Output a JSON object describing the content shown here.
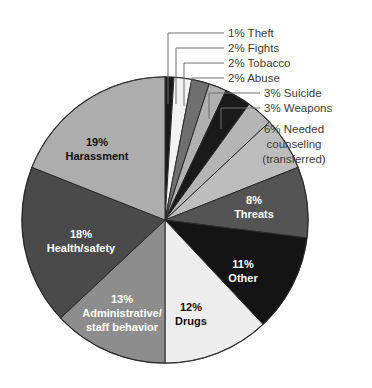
{
  "chart_data": {
    "type": "pie",
    "title": "",
    "subtitle": "",
    "xlabel": "",
    "ylabel": "",
    "legend_position": "none",
    "grid": false,
    "units": "percent",
    "total": 100,
    "start_angle_deg": 0,
    "direction": "clockwise",
    "categories": [
      "Theft",
      "Fights",
      "Tobacco",
      "Abuse",
      "Suicide",
      "Weapons",
      "Needed counseling (transferred)",
      "Threats",
      "Other",
      "Drugs",
      "Administrative/ staff behavior",
      "Health/safety",
      "Harassment"
    ],
    "values": [
      1,
      2,
      2,
      2,
      3,
      3,
      6,
      8,
      11,
      12,
      13,
      18,
      19
    ],
    "slices": [
      {
        "label": "Theft",
        "value": 1,
        "pct_text": "1%",
        "color": "#1a1a1a",
        "label_style": "callout",
        "text_color": "#3a3a3a"
      },
      {
        "label": "Fights",
        "value": 2,
        "pct_text": "2%",
        "color": "#f2f2f2",
        "label_style": "callout",
        "text_color": "#3a3a3a"
      },
      {
        "label": "Tobacco",
        "value": 2,
        "pct_text": "2%",
        "color": "#6f6f6f",
        "label_style": "callout",
        "text_color": "#3a3a3a"
      },
      {
        "label": "Abuse",
        "value": 2,
        "pct_text": "2%",
        "color": "#b0b0b0",
        "label_style": "callout",
        "text_color": "#3a3a3a"
      },
      {
        "label": "Suicide",
        "value": 3,
        "pct_text": "3%",
        "color": "#1a1a1a",
        "label_style": "callout",
        "text_color": "#3a3a3a"
      },
      {
        "label": "Weapons",
        "value": 3,
        "pct_text": "3%",
        "color": "#b5b5b5",
        "label_style": "callout",
        "text_color": "#3a3a3a"
      },
      {
        "label": "Needed counseling (transferred)",
        "value": 6,
        "pct_text": "6%",
        "color": "#bdbdbd",
        "label_style": "outside",
        "text_color": "#3a3a3a"
      },
      {
        "label": "Threats",
        "value": 8,
        "pct_text": "8%",
        "color": "#545454",
        "label_style": "inside",
        "text_color": "#ffffff"
      },
      {
        "label": "Other",
        "value": 11,
        "pct_text": "11%",
        "color": "#141414",
        "label_style": "inside",
        "text_color": "#ffffff"
      },
      {
        "label": "Drugs",
        "value": 12,
        "pct_text": "12%",
        "color": "#ededed",
        "label_style": "inside",
        "text_color": "#111111"
      },
      {
        "label": "Administrative/ staff behavior",
        "value": 13,
        "pct_text": "13%",
        "color": "#8d8d8d",
        "label_style": "inside",
        "text_color": "#ffffff"
      },
      {
        "label": "Health/safety",
        "value": 18,
        "pct_text": "18%",
        "color": "#4a4a4a",
        "label_style": "inside",
        "text_color": "#ffffff"
      },
      {
        "label": "Harassment",
        "value": 19,
        "pct_text": "19%",
        "color": "#adadad",
        "label_style": "inside",
        "text_color": "#111111"
      }
    ]
  },
  "callouts": {
    "theft": {
      "pct": "1%",
      "name": "Theft"
    },
    "fights": {
      "pct": "2%",
      "name": "Fights"
    },
    "tobacco": {
      "pct": "2%",
      "name": "Tobacco"
    },
    "abuse": {
      "pct": "2%",
      "name": "Abuse"
    },
    "suicide": {
      "pct": "3%",
      "name": "Suicide"
    },
    "weapons": {
      "pct": "3%",
      "name": "Weapons"
    }
  },
  "callout_text": {
    "theft": "1% Theft",
    "fights": "2% Fights",
    "tobacco": "2% Tobacco",
    "abuse": "2% Abuse",
    "suicide": "3% Suicide",
    "weapons": "3% Weapons"
  },
  "outside_label": {
    "line1": "6% Needed",
    "line2": "counseling",
    "line3": "(transferred)"
  },
  "inside_labels": {
    "threats": {
      "line1": "8%",
      "line2": "Threats"
    },
    "other": {
      "line1": "11%",
      "line2": "Other"
    },
    "drugs": {
      "line1": "12%",
      "line2": "Drugs"
    },
    "admin": {
      "line1": "13%",
      "line2": "Administrative/",
      "line3": "staff behavior"
    },
    "health": {
      "line1": "18%",
      "line2": "Health/safety"
    },
    "harassment": {
      "line1": "19%",
      "line2": "Harassment"
    }
  },
  "colors": {
    "background": "#ffffff",
    "leader_line": "#6e6e6e",
    "outline": "#2b2b2b",
    "text_dark": "#3a3a3a",
    "text_light": "#ffffff"
  }
}
